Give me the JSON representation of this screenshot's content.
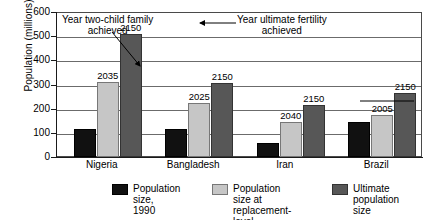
{
  "chart_data": {
    "type": "bar",
    "title": "",
    "xlabel": "",
    "ylabel": "Population (millions)",
    "ylim": [
      0,
      600
    ],
    "yticks": [
      600,
      500,
      400,
      300,
      200,
      100,
      0
    ],
    "grid": true,
    "legend_position": "bottom",
    "categories": [
      "Nigeria",
      "Bangladesh",
      "Iran",
      "Brazil"
    ],
    "series": [
      {
        "name": "Population size, 1990",
        "color": "#111111",
        "values": [
          115,
          115,
          58,
          145
        ],
        "point_labels": [
          "",
          "",
          "",
          ""
        ]
      },
      {
        "name": "Population size at replacement-level fertility",
        "color": "#c6c6c6",
        "values": [
          310,
          225,
          145,
          175
        ],
        "point_labels": [
          "2035",
          "2025",
          "2040",
          "2005"
        ]
      },
      {
        "name": "Ultimate population size",
        "color": "#575757",
        "values": [
          510,
          305,
          215,
          265
        ],
        "point_labels": [
          "2150",
          "2150",
          "2150",
          "2150"
        ]
      }
    ],
    "annotations": [
      {
        "text_line1": "Year two-child family",
        "text_line2": "achieved",
        "points_to": "2035"
      },
      {
        "text_line1": "Year ultimate fertility",
        "text_line2": "achieved",
        "points_to": "2150"
      }
    ]
  },
  "legend": {
    "items": [
      {
        "label": "Population size,\n1990",
        "color": "#111111"
      },
      {
        "label": "Population size at\nreplacement-level\nfertility",
        "color": "#c6c6c6"
      },
      {
        "label": "Ultimate\npopulation size",
        "color": "#575757"
      }
    ]
  }
}
